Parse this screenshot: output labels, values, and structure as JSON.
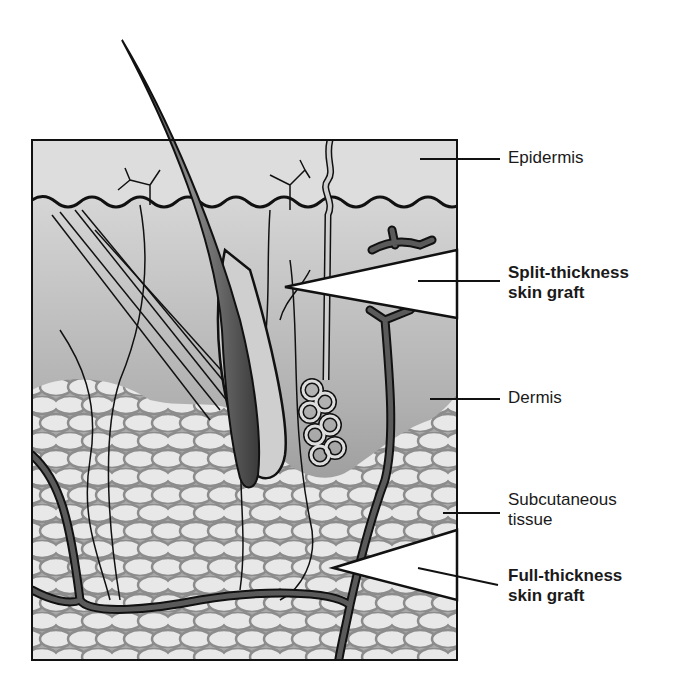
{
  "figure": {
    "colors": {
      "epidermis_fill": "#dcdcdc",
      "dermis_top": "#d0d0d0",
      "dermis_bottom": "#7a7a7a",
      "fat_fill": "#e6e6e6",
      "fat_stroke": "#8c8c8c",
      "vessel": "#555555",
      "hair": "#5a5a5a",
      "outline": "#111111"
    }
  },
  "labels": [
    {
      "id": "epidermis",
      "text": "Epidermis",
      "bold": false
    },
    {
      "id": "split_thickness",
      "text": "Split-thickness\nskin graft",
      "bold": true
    },
    {
      "id": "dermis",
      "text": "Dermis",
      "bold": false
    },
    {
      "id": "subcutaneous",
      "text": "Subcutaneous\ntissue",
      "bold": false
    },
    {
      "id": "full_thickness",
      "text": "Full-thickness\nskin graft",
      "bold": true
    }
  ]
}
